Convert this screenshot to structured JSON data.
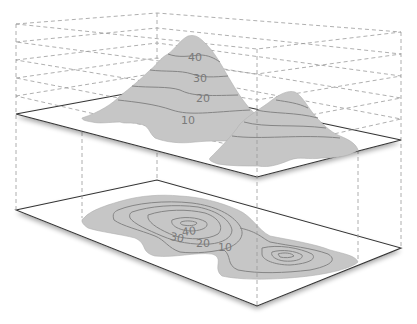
{
  "diagram": {
    "colors": {
      "terrain_fill": "#c6c6c6",
      "contour_line": "#858585",
      "plane_edge": "#333333",
      "guide_dash": "#9a9a9a",
      "label": "#7a7a7a"
    },
    "terrain_3d": {
      "contour_labels": [
        "40",
        "30",
        "20",
        "10"
      ]
    },
    "contour_map_2d": {
      "contour_labels": [
        "40",
        "30",
        "20",
        "10"
      ]
    },
    "elevation_levels": [
      10,
      20,
      30,
      40
    ]
  }
}
